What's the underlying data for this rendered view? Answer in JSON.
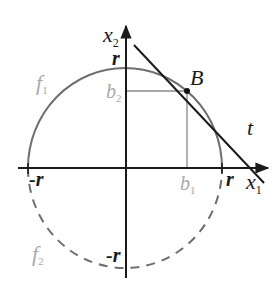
{
  "diagram": {
    "axes": {
      "x_label": "x",
      "x_sub": "1",
      "y_label": "x",
      "y_sub": "2"
    },
    "ticks": {
      "r_right": "r",
      "r_left": "-r",
      "r_top": "r",
      "r_bottom": "-r",
      "b1": "b",
      "b1_sub": "1",
      "b2": "b",
      "b2_sub": "2"
    },
    "curves": {
      "f1": "f",
      "f1_sub": "1",
      "f2": "f",
      "f2_sub": "2"
    },
    "point": "B",
    "tangent": "t",
    "colors": {
      "axis": "#1a1a1a",
      "upper_arc": "#6e6e6e",
      "lower_arc": "#6e6e6e",
      "tangent": "#1a1a1a",
      "guide": "#888888",
      "faded_label": "#a8a8a8"
    }
  }
}
